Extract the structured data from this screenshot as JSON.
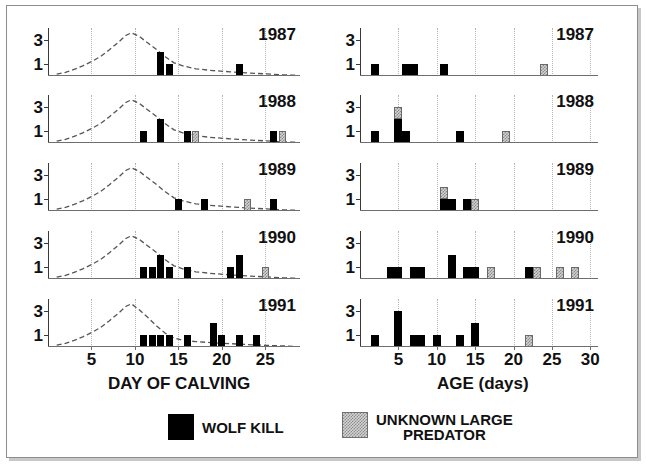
{
  "figure": {
    "background": "#ffffff",
    "frame_color": "#8d8d8d"
  },
  "colors": {
    "wolf_kill": "#000000",
    "unknown_predator": "#d2d2d2",
    "axis": "#3a3a3a",
    "grid": "#b4b4b4",
    "curve": "#555555"
  },
  "legend": {
    "items": [
      {
        "label": "WOLF KILL",
        "swatch": "wolf-kill-swatch",
        "pattern": "solid-black"
      },
      {
        "label_line1": "UNKNOWN LARGE",
        "label_line2": "PREDATOR",
        "swatch": "unknown-predator-swatch",
        "pattern": "stippled-gray"
      }
    ]
  },
  "chart_data": [
    {
      "type": "bar",
      "panel": "left",
      "title": "",
      "xlabel": "DAY OF CALVING",
      "ylabel": "",
      "xlim": [
        0,
        29
      ],
      "ylim": [
        0,
        4
      ],
      "xticks": [
        5,
        10,
        15,
        20,
        25
      ],
      "yticks": [
        1,
        3
      ],
      "gridlines": [
        5,
        10,
        15,
        20,
        25
      ],
      "grid": true,
      "legend_position": "bottom",
      "stacked": true,
      "series_names": [
        "WOLF KILL",
        "UNKNOWN LARGE PREDATOR"
      ],
      "overlay_curve": "calving distribution (dashed)",
      "panels": [
        {
          "year": "1987",
          "bars": [
            {
              "x": 13,
              "wolf": 2,
              "unknown": 0
            },
            {
              "x": 14,
              "wolf": 1,
              "unknown": 0
            },
            {
              "x": 22,
              "wolf": 1,
              "unknown": 0
            }
          ],
          "curve": [
            {
              "x": 1,
              "y": 0.15
            },
            {
              "x": 2,
              "y": 0.3
            },
            {
              "x": 3,
              "y": 0.55
            },
            {
              "x": 4,
              "y": 0.85
            },
            {
              "x": 5,
              "y": 1.2
            },
            {
              "x": 6,
              "y": 1.6
            },
            {
              "x": 7,
              "y": 2.15
            },
            {
              "x": 8,
              "y": 2.75
            },
            {
              "x": 9,
              "y": 3.4
            },
            {
              "x": 9.6,
              "y": 3.6
            },
            {
              "x": 10.5,
              "y": 3.3
            },
            {
              "x": 11.5,
              "y": 2.75
            },
            {
              "x": 12.5,
              "y": 2.2
            },
            {
              "x": 13.5,
              "y": 1.6
            },
            {
              "x": 14.5,
              "y": 1.1
            },
            {
              "x": 15.5,
              "y": 0.85
            },
            {
              "x": 17,
              "y": 0.6
            },
            {
              "x": 19,
              "y": 0.45
            },
            {
              "x": 21,
              "y": 0.35
            },
            {
              "x": 23,
              "y": 0.25
            },
            {
              "x": 25,
              "y": 0.18
            },
            {
              "x": 27,
              "y": 0.1
            },
            {
              "x": 28.5,
              "y": 0.06
            }
          ]
        },
        {
          "year": "1988",
          "bars": [
            {
              "x": 11,
              "wolf": 1,
              "unknown": 0
            },
            {
              "x": 13,
              "wolf": 2,
              "unknown": 0
            },
            {
              "x": 16,
              "wolf": 1,
              "unknown": 0
            },
            {
              "x": 17,
              "wolf": 0,
              "unknown": 1
            },
            {
              "x": 26,
              "wolf": 1,
              "unknown": 0
            },
            {
              "x": 27,
              "wolf": 0,
              "unknown": 1
            }
          ],
          "curve": [
            {
              "x": 1,
              "y": 0.15
            },
            {
              "x": 2,
              "y": 0.3
            },
            {
              "x": 3,
              "y": 0.55
            },
            {
              "x": 4,
              "y": 0.85
            },
            {
              "x": 5,
              "y": 1.2
            },
            {
              "x": 6,
              "y": 1.6
            },
            {
              "x": 7,
              "y": 2.15
            },
            {
              "x": 8,
              "y": 2.75
            },
            {
              "x": 9,
              "y": 3.4
            },
            {
              "x": 9.6,
              "y": 3.6
            },
            {
              "x": 10.5,
              "y": 3.3
            },
            {
              "x": 11.5,
              "y": 2.75
            },
            {
              "x": 12.5,
              "y": 2.2
            },
            {
              "x": 13.5,
              "y": 1.6
            },
            {
              "x": 14.5,
              "y": 1.1
            },
            {
              "x": 15.5,
              "y": 0.85
            },
            {
              "x": 17,
              "y": 0.6
            },
            {
              "x": 19,
              "y": 0.45
            },
            {
              "x": 21,
              "y": 0.35
            },
            {
              "x": 23,
              "y": 0.25
            },
            {
              "x": 25,
              "y": 0.18
            },
            {
              "x": 27,
              "y": 0.1
            },
            {
              "x": 28.5,
              "y": 0.06
            }
          ]
        },
        {
          "year": "1989",
          "bars": [
            {
              "x": 15,
              "wolf": 1,
              "unknown": 0
            },
            {
              "x": 18,
              "wolf": 1,
              "unknown": 0
            },
            {
              "x": 23,
              "wolf": 0,
              "unknown": 1
            },
            {
              "x": 26,
              "wolf": 1,
              "unknown": 0
            }
          ],
          "curve": [
            {
              "x": 1,
              "y": 0.15
            },
            {
              "x": 2,
              "y": 0.3
            },
            {
              "x": 3,
              "y": 0.55
            },
            {
              "x": 4,
              "y": 0.85
            },
            {
              "x": 5,
              "y": 1.2
            },
            {
              "x": 6,
              "y": 1.6
            },
            {
              "x": 7,
              "y": 2.15
            },
            {
              "x": 8,
              "y": 2.75
            },
            {
              "x": 9,
              "y": 3.4
            },
            {
              "x": 9.6,
              "y": 3.6
            },
            {
              "x": 10.5,
              "y": 3.3
            },
            {
              "x": 11.5,
              "y": 2.75
            },
            {
              "x": 12.5,
              "y": 2.2
            },
            {
              "x": 13.5,
              "y": 1.6
            },
            {
              "x": 14.5,
              "y": 1.1
            },
            {
              "x": 15.5,
              "y": 0.85
            },
            {
              "x": 17,
              "y": 0.6
            },
            {
              "x": 19,
              "y": 0.45
            },
            {
              "x": 21,
              "y": 0.35
            },
            {
              "x": 23,
              "y": 0.25
            },
            {
              "x": 25,
              "y": 0.18
            },
            {
              "x": 27,
              "y": 0.1
            },
            {
              "x": 28.5,
              "y": 0.06
            }
          ]
        },
        {
          "year": "1990",
          "bars": [
            {
              "x": 11,
              "wolf": 1,
              "unknown": 0
            },
            {
              "x": 12,
              "wolf": 1,
              "unknown": 0
            },
            {
              "x": 13,
              "wolf": 2,
              "unknown": 0
            },
            {
              "x": 14,
              "wolf": 1,
              "unknown": 0
            },
            {
              "x": 16,
              "wolf": 1,
              "unknown": 0
            },
            {
              "x": 21,
              "wolf": 1,
              "unknown": 0
            },
            {
              "x": 22,
              "wolf": 2,
              "unknown": 0
            },
            {
              "x": 25,
              "wolf": 0,
              "unknown": 1
            }
          ],
          "curve": [
            {
              "x": 1,
              "y": 0.15
            },
            {
              "x": 2,
              "y": 0.3
            },
            {
              "x": 3,
              "y": 0.55
            },
            {
              "x": 4,
              "y": 0.85
            },
            {
              "x": 5,
              "y": 1.2
            },
            {
              "x": 6,
              "y": 1.6
            },
            {
              "x": 7,
              "y": 2.15
            },
            {
              "x": 8,
              "y": 2.75
            },
            {
              "x": 9,
              "y": 3.4
            },
            {
              "x": 9.6,
              "y": 3.6
            },
            {
              "x": 10.5,
              "y": 3.3
            },
            {
              "x": 11.5,
              "y": 2.75
            },
            {
              "x": 12.5,
              "y": 2.2
            },
            {
              "x": 13.5,
              "y": 1.6
            },
            {
              "x": 14.5,
              "y": 1.1
            },
            {
              "x": 15.5,
              "y": 0.85
            },
            {
              "x": 17,
              "y": 0.6
            },
            {
              "x": 19,
              "y": 0.45
            },
            {
              "x": 21,
              "y": 0.35
            },
            {
              "x": 23,
              "y": 0.25
            },
            {
              "x": 25,
              "y": 0.18
            },
            {
              "x": 27,
              "y": 0.1
            },
            {
              "x": 28.5,
              "y": 0.06
            }
          ]
        },
        {
          "year": "1991",
          "bars": [
            {
              "x": 11,
              "wolf": 1,
              "unknown": 0
            },
            {
              "x": 12,
              "wolf": 1,
              "unknown": 0
            },
            {
              "x": 13,
              "wolf": 1,
              "unknown": 0
            },
            {
              "x": 14,
              "wolf": 1,
              "unknown": 0
            },
            {
              "x": 16,
              "wolf": 1,
              "unknown": 0
            },
            {
              "x": 19,
              "wolf": 2,
              "unknown": 0
            },
            {
              "x": 20,
              "wolf": 1,
              "unknown": 0
            },
            {
              "x": 22,
              "wolf": 1,
              "unknown": 0
            },
            {
              "x": 24,
              "wolf": 1,
              "unknown": 0
            }
          ],
          "curve": [
            {
              "x": 1,
              "y": 0.15
            },
            {
              "x": 2,
              "y": 0.3
            },
            {
              "x": 3,
              "y": 0.55
            },
            {
              "x": 4,
              "y": 0.85
            },
            {
              "x": 5,
              "y": 1.2
            },
            {
              "x": 6,
              "y": 1.6
            },
            {
              "x": 7,
              "y": 2.15
            },
            {
              "x": 8,
              "y": 2.75
            },
            {
              "x": 9,
              "y": 3.4
            },
            {
              "x": 9.6,
              "y": 3.6
            },
            {
              "x": 10.5,
              "y": 3.1
            },
            {
              "x": 11.5,
              "y": 2.45
            },
            {
              "x": 12.5,
              "y": 1.75
            },
            {
              "x": 13.5,
              "y": 1.15
            },
            {
              "x": 14.5,
              "y": 0.75
            },
            {
              "x": 15.5,
              "y": 0.55
            },
            {
              "x": 17,
              "y": 0.45
            },
            {
              "x": 19,
              "y": 0.35
            },
            {
              "x": 21,
              "y": 0.28
            },
            {
              "x": 23,
              "y": 0.2
            },
            {
              "x": 25,
              "y": 0.14
            },
            {
              "x": 27,
              "y": 0.09
            },
            {
              "x": 28.5,
              "y": 0.05
            }
          ]
        }
      ]
    },
    {
      "type": "bar",
      "panel": "right",
      "title": "",
      "xlabel": "AGE (days)",
      "ylabel": "",
      "xlim": [
        0,
        31
      ],
      "ylim": [
        0,
        4
      ],
      "xticks": [
        5,
        10,
        15,
        20,
        25,
        30
      ],
      "yticks": [
        1,
        3
      ],
      "gridlines": [
        5,
        10,
        15,
        20,
        25,
        30
      ],
      "grid": true,
      "legend_position": "bottom",
      "stacked": true,
      "series_names": [
        "WOLF KILL",
        "UNKNOWN LARGE PREDATOR"
      ],
      "overlay_curve": null,
      "panels": [
        {
          "year": "1987",
          "bars": [
            {
              "x": 2,
              "wolf": 1,
              "unknown": 0
            },
            {
              "x": 6,
              "wolf": 1,
              "unknown": 0
            },
            {
              "x": 7,
              "wolf": 1,
              "unknown": 0
            },
            {
              "x": 11,
              "wolf": 1,
              "unknown": 0
            },
            {
              "x": 24,
              "wolf": 0,
              "unknown": 1
            }
          ]
        },
        {
          "year": "1988",
          "bars": [
            {
              "x": 2,
              "wolf": 1,
              "unknown": 0
            },
            {
              "x": 5,
              "wolf": 2,
              "unknown": 1
            },
            {
              "x": 6,
              "wolf": 1,
              "unknown": 0
            },
            {
              "x": 13,
              "wolf": 1,
              "unknown": 0
            },
            {
              "x": 19,
              "wolf": 0,
              "unknown": 1
            }
          ]
        },
        {
          "year": "1989",
          "bars": [
            {
              "x": 11,
              "wolf": 1,
              "unknown": 1
            },
            {
              "x": 12,
              "wolf": 1,
              "unknown": 0
            },
            {
              "x": 14,
              "wolf": 1,
              "unknown": 0
            },
            {
              "x": 15,
              "wolf": 0,
              "unknown": 1
            }
          ]
        },
        {
          "year": "1990",
          "bars": [
            {
              "x": 4,
              "wolf": 1,
              "unknown": 0
            },
            {
              "x": 5,
              "wolf": 1,
              "unknown": 0
            },
            {
              "x": 7,
              "wolf": 1,
              "unknown": 0
            },
            {
              "x": 8,
              "wolf": 1,
              "unknown": 0
            },
            {
              "x": 12,
              "wolf": 2,
              "unknown": 0
            },
            {
              "x": 14,
              "wolf": 1,
              "unknown": 0
            },
            {
              "x": 15,
              "wolf": 1,
              "unknown": 0
            },
            {
              "x": 17,
              "wolf": 0,
              "unknown": 1
            },
            {
              "x": 22,
              "wolf": 1,
              "unknown": 0
            },
            {
              "x": 23,
              "wolf": 0,
              "unknown": 1
            },
            {
              "x": 26,
              "wolf": 0,
              "unknown": 1
            },
            {
              "x": 28,
              "wolf": 0,
              "unknown": 1
            }
          ]
        },
        {
          "year": "1991",
          "bars": [
            {
              "x": 2,
              "wolf": 1,
              "unknown": 0
            },
            {
              "x": 5,
              "wolf": 3,
              "unknown": 0
            },
            {
              "x": 7,
              "wolf": 1,
              "unknown": 0
            },
            {
              "x": 8,
              "wolf": 1,
              "unknown": 0
            },
            {
              "x": 10,
              "wolf": 1,
              "unknown": 0
            },
            {
              "x": 13,
              "wolf": 1,
              "unknown": 0
            },
            {
              "x": 15,
              "wolf": 2,
              "unknown": 0
            },
            {
              "x": 22,
              "wolf": 0,
              "unknown": 1
            }
          ]
        }
      ]
    }
  ]
}
